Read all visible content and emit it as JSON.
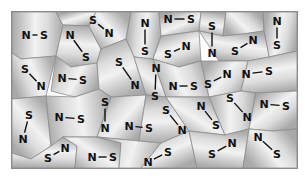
{
  "figure": {
    "frame": {
      "x": 11,
      "y": 11,
      "width": 285,
      "height": 156
    },
    "colors": {
      "cell_light": "#f2f2f2",
      "cell_dark": "#a9a9a9",
      "cell_edge": "#8c8c8c",
      "label": "#111111",
      "background": "#ffffff"
    },
    "molecules": [
      {
        "a": "N",
        "ax": 25,
        "ay": 34,
        "b": "S",
        "bx": 43,
        "by": 34
      },
      {
        "a": "N",
        "ax": 69,
        "ay": 34,
        "b": "S",
        "bx": 85,
        "by": 56
      },
      {
        "a": "S",
        "ax": 92,
        "ay": 19,
        "b": "N",
        "bx": 108,
        "by": 32
      },
      {
        "a": "N",
        "ax": 144,
        "ay": 22,
        "b": "S",
        "bx": 144,
        "by": 50
      },
      {
        "a": "N",
        "ax": 167,
        "ay": 18,
        "b": "S",
        "bx": 190,
        "by": 18
      },
      {
        "a": "S",
        "ax": 211,
        "ay": 25,
        "b": "N",
        "bx": 211,
        "by": 52
      },
      {
        "a": "S",
        "ax": 234,
        "ay": 50,
        "b": "N",
        "bx": 252,
        "by": 39
      },
      {
        "a": "N",
        "ax": 276,
        "ay": 20,
        "b": "S",
        "bx": 276,
        "by": 44
      },
      {
        "a": "S",
        "ax": 24,
        "ay": 68,
        "b": "N",
        "bx": 40,
        "by": 85
      },
      {
        "a": "N",
        "ax": 61,
        "ay": 77,
        "b": "S",
        "bx": 82,
        "by": 79
      },
      {
        "a": "S",
        "ax": 118,
        "ay": 61,
        "b": "N",
        "bx": 134,
        "by": 84
      },
      {
        "a": "N",
        "ax": 155,
        "ay": 67,
        "b": "S",
        "bx": 154,
        "by": 95
      },
      {
        "a": "S",
        "ax": 167,
        "ay": 53,
        "b": "N",
        "bx": 185,
        "by": 45
      },
      {
        "a": "N",
        "ax": 172,
        "ay": 85,
        "b": "S",
        "bx": 193,
        "by": 85
      },
      {
        "a": "S",
        "ax": 207,
        "ay": 83,
        "b": "N",
        "bx": 226,
        "by": 73
      },
      {
        "a": "N",
        "ax": 245,
        "ay": 73,
        "b": "S",
        "bx": 268,
        "by": 70
      },
      {
        "a": "S",
        "ax": 229,
        "ay": 97,
        "b": "N",
        "bx": 246,
        "by": 116
      },
      {
        "a": "N",
        "ax": 263,
        "ay": 103,
        "b": "S",
        "bx": 285,
        "by": 105
      },
      {
        "a": "S",
        "ax": 28,
        "ay": 114,
        "b": "N",
        "bx": 22,
        "by": 138
      },
      {
        "a": "N",
        "ax": 58,
        "ay": 116,
        "b": "S",
        "bx": 80,
        "by": 118
      },
      {
        "a": "S",
        "ax": 104,
        "ay": 101,
        "b": "N",
        "bx": 104,
        "by": 127
      },
      {
        "a": "N",
        "ax": 128,
        "ay": 125,
        "b": "S",
        "bx": 148,
        "by": 127
      },
      {
        "a": "S",
        "ax": 165,
        "ay": 109,
        "b": "N",
        "bx": 181,
        "by": 129
      },
      {
        "a": "N",
        "ax": 200,
        "ay": 105,
        "b": "S",
        "bx": 215,
        "by": 124
      },
      {
        "a": "S",
        "ax": 47,
        "ay": 157,
        "b": "N",
        "bx": 64,
        "by": 147
      },
      {
        "a": "N",
        "ax": 91,
        "ay": 156,
        "b": "S",
        "bx": 112,
        "by": 156
      },
      {
        "a": "N",
        "ax": 147,
        "ay": 161,
        "b": "S",
        "bx": 167,
        "by": 151
      },
      {
        "a": "S",
        "ax": 211,
        "ay": 153,
        "b": "N",
        "bx": 231,
        "by": 142
      },
      {
        "a": "N",
        "ax": 257,
        "ay": 136,
        "b": "S",
        "bx": 276,
        "by": 153
      }
    ],
    "cells": [
      [
        [
          11,
          11
        ],
        [
          55,
          11
        ],
        [
          62,
          24
        ],
        [
          55,
          55
        ],
        [
          20,
          58
        ],
        [
          11,
          52
        ]
      ],
      [
        [
          55,
          11
        ],
        [
          95,
          11
        ],
        [
          88,
          25
        ],
        [
          62,
          24
        ]
      ],
      [
        [
          62,
          24
        ],
        [
          88,
          25
        ],
        [
          100,
          48
        ],
        [
          96,
          62
        ],
        [
          70,
          66
        ],
        [
          55,
          55
        ]
      ],
      [
        [
          95,
          11
        ],
        [
          130,
          11
        ],
        [
          125,
          38
        ],
        [
          100,
          48
        ],
        [
          88,
          25
        ]
      ],
      [
        [
          130,
          11
        ],
        [
          158,
          11
        ],
        [
          160,
          35
        ],
        [
          152,
          58
        ],
        [
          133,
          56
        ],
        [
          125,
          38
        ]
      ],
      [
        [
          158,
          11
        ],
        [
          200,
          11
        ],
        [
          198,
          30
        ],
        [
          160,
          35
        ]
      ],
      [
        [
          200,
          11
        ],
        [
          225,
          11
        ],
        [
          222,
          35
        ],
        [
          198,
          30
        ]
      ],
      [
        [
          225,
          11
        ],
        [
          262,
          11
        ],
        [
          263,
          30
        ],
        [
          242,
          33
        ],
        [
          222,
          35
        ]
      ],
      [
        [
          262,
          11
        ],
        [
          296,
          11
        ],
        [
          296,
          50
        ],
        [
          268,
          56
        ],
        [
          263,
          30
        ]
      ],
      [
        [
          160,
          35
        ],
        [
          198,
          30
        ],
        [
          200,
          60
        ],
        [
          178,
          66
        ],
        [
          152,
          58
        ]
      ],
      [
        [
          222,
          35
        ],
        [
          242,
          33
        ],
        [
          263,
          30
        ],
        [
          268,
          56
        ],
        [
          247,
          60
        ],
        [
          218,
          60
        ],
        [
          198,
          30
        ]
      ],
      [
        [
          11,
          52
        ],
        [
          20,
          58
        ],
        [
          55,
          55
        ],
        [
          45,
          95
        ],
        [
          11,
          98
        ]
      ],
      [
        [
          55,
          55
        ],
        [
          70,
          66
        ],
        [
          96,
          62
        ],
        [
          98,
          88
        ],
        [
          74,
          96
        ],
        [
          50,
          90
        ]
      ],
      [
        [
          96,
          62
        ],
        [
          100,
          48
        ],
        [
          125,
          38
        ],
        [
          133,
          56
        ],
        [
          145,
          94
        ],
        [
          110,
          96
        ],
        [
          98,
          88
        ]
      ],
      [
        [
          133,
          56
        ],
        [
          152,
          58
        ],
        [
          165,
          96
        ],
        [
          145,
          94
        ]
      ],
      [
        [
          152,
          58
        ],
        [
          178,
          66
        ],
        [
          200,
          60
        ],
        [
          208,
          96
        ],
        [
          165,
          96
        ]
      ],
      [
        [
          200,
          60
        ],
        [
          218,
          60
        ],
        [
          247,
          60
        ],
        [
          240,
          90
        ],
        [
          208,
          96
        ]
      ],
      [
        [
          247,
          60
        ],
        [
          268,
          56
        ],
        [
          296,
          50
        ],
        [
          296,
          90
        ],
        [
          255,
          92
        ],
        [
          240,
          90
        ]
      ],
      [
        [
          11,
          98
        ],
        [
          45,
          95
        ],
        [
          50,
          145
        ],
        [
          30,
          158
        ],
        [
          11,
          152
        ]
      ],
      [
        [
          45,
          95
        ],
        [
          74,
          96
        ],
        [
          98,
          88
        ],
        [
          110,
          96
        ],
        [
          96,
          136
        ],
        [
          62,
          136
        ],
        [
          50,
          145
        ]
      ],
      [
        [
          110,
          96
        ],
        [
          145,
          94
        ],
        [
          138,
          140
        ],
        [
          96,
          136
        ]
      ],
      [
        [
          145,
          94
        ],
        [
          165,
          96
        ],
        [
          188,
          130
        ],
        [
          160,
          142
        ],
        [
          138,
          140
        ]
      ],
      [
        [
          165,
          96
        ],
        [
          208,
          96
        ],
        [
          224,
          134
        ],
        [
          188,
          130
        ]
      ],
      [
        [
          208,
          96
        ],
        [
          240,
          90
        ],
        [
          255,
          92
        ],
        [
          248,
          128
        ],
        [
          224,
          134
        ]
      ],
      [
        [
          255,
          92
        ],
        [
          296,
          90
        ],
        [
          296,
          128
        ],
        [
          272,
          130
        ],
        [
          248,
          128
        ]
      ],
      [
        [
          11,
          152
        ],
        [
          30,
          158
        ],
        [
          50,
          145
        ],
        [
          62,
          136
        ],
        [
          76,
          145
        ],
        [
          74,
          167
        ],
        [
          11,
          167
        ]
      ],
      [
        [
          62,
          136
        ],
        [
          96,
          136
        ],
        [
          120,
          142
        ],
        [
          118,
          167
        ],
        [
          74,
          167
        ],
        [
          76,
          145
        ]
      ],
      [
        [
          96,
          136
        ],
        [
          138,
          140
        ],
        [
          160,
          142
        ],
        [
          140,
          167
        ],
        [
          118,
          167
        ],
        [
          120,
          142
        ]
      ],
      [
        [
          160,
          142
        ],
        [
          188,
          130
        ],
        [
          196,
          167
        ],
        [
          140,
          167
        ]
      ],
      [
        [
          188,
          130
        ],
        [
          224,
          134
        ],
        [
          248,
          128
        ],
        [
          242,
          167
        ],
        [
          196,
          167
        ]
      ],
      [
        [
          248,
          128
        ],
        [
          272,
          130
        ],
        [
          296,
          128
        ],
        [
          296,
          167
        ],
        [
          242,
          167
        ]
      ]
    ]
  }
}
